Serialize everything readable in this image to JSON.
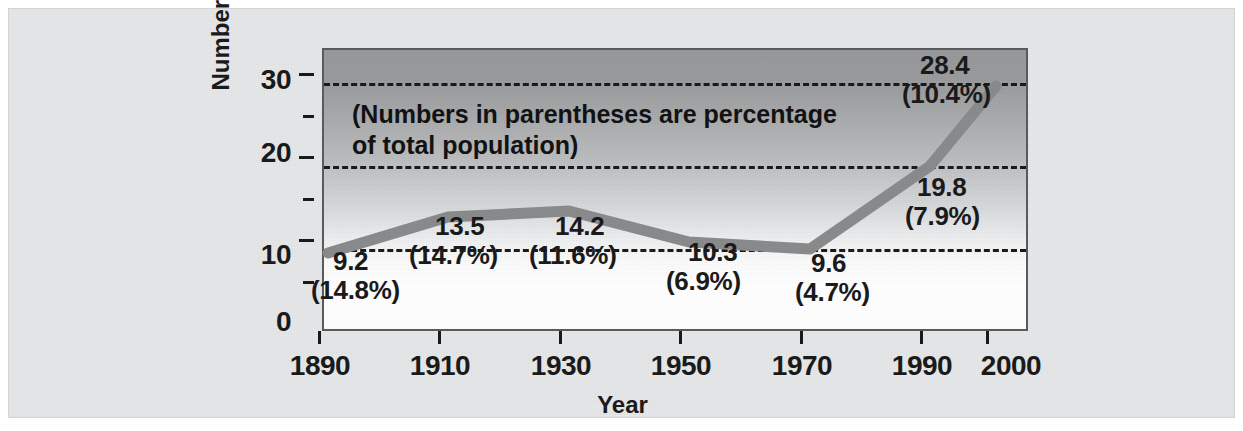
{
  "chart_data": {
    "type": "line",
    "title": "",
    "xlabel": "Year",
    "ylabel": "Number (in millions)",
    "annotation": "(Numbers in parentheses are percentage of total population)",
    "annotation_line1": "(Numbers in parentheses are percentage",
    "annotation_line2": "of total population)",
    "x": [
      1890,
      1910,
      1930,
      1950,
      1970,
      1990,
      2000
    ],
    "values": [
      9.2,
      13.5,
      14.2,
      10.3,
      9.6,
      19.8,
      28.4
    ],
    "percent_of_population": [
      "14.8%",
      "14.7%",
      "11.6%",
      "6.9%",
      "4.7%",
      "7.9%",
      "10.4%"
    ],
    "points": [
      {
        "year": "1890",
        "value": "9.2",
        "percent": "(14.8%)"
      },
      {
        "year": "1910",
        "value": "13.5",
        "percent": "(14.7%)"
      },
      {
        "year": "1930",
        "value": "14.2",
        "percent": "(11.6%)"
      },
      {
        "year": "1950",
        "value": "10.3",
        "percent": "(6.9%)"
      },
      {
        "year": "1970",
        "value": "9.6",
        "percent": "(4.7%)"
      },
      {
        "year": "1990",
        "value": "19.8",
        "percent": "(7.9%)"
      },
      {
        "year": "2000",
        "value": "28.4",
        "percent": "(10.4%)"
      }
    ],
    "x_tick_labels": [
      "1890",
      "1910",
      "1930",
      "1950",
      "1970",
      "1990",
      "2000"
    ],
    "y_tick_labels": [
      "0",
      "10",
      "20",
      "30"
    ],
    "y_ticks": [
      0,
      10,
      20,
      30
    ],
    "y_minor_ticks": [
      5,
      15,
      25
    ],
    "ylim": [
      0,
      34
    ],
    "xlim": [
      1890,
      2000
    ],
    "grid": "horizontal-dashed",
    "legend": "none",
    "series_color": "#8a8b8d",
    "text_color": "#1a1a1a",
    "plot_bg_top": "#97999b",
    "plot_bg_bottom": "#ffffff",
    "frame_bg": "#e6e7e8"
  }
}
